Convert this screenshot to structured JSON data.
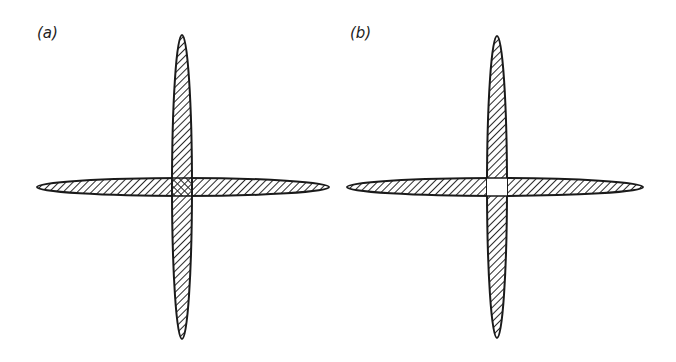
{
  "panels": [
    {
      "label": "(a)",
      "description": "Two crossed hatched ellipses; overlap region is cross-hatched (darker)",
      "overlap": "cross-hatched"
    },
    {
      "label": "(b)",
      "description": "Two crossed hatched ellipses; overlap region is empty (white)",
      "overlap": "empty"
    }
  ],
  "colors": {
    "stroke": "#1a1a1a",
    "hatch": "#2a2a2a",
    "background": "#ffffff"
  }
}
